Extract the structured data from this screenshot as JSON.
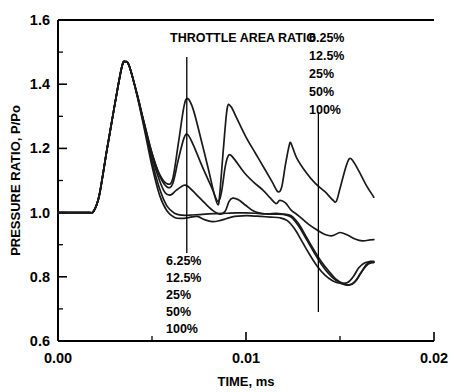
{
  "chart_data": {
    "type": "line",
    "title": "",
    "xlabel": "TIME, ms",
    "ylabel": "PRESSURE RATIO, P/Po",
    "xlim": [
      0.0,
      0.02
    ],
    "ylim": [
      0.6,
      1.6
    ],
    "xticks": [
      "0.00",
      "0.01",
      "0.02"
    ],
    "xtick_values": [
      0.0,
      0.01,
      0.02
    ],
    "xminor_values": [
      0.005,
      0.015
    ],
    "yticks": [
      "0.6",
      "0.8",
      "1.0",
      "1.2",
      "1.4",
      "1.6"
    ],
    "ytick_values": [
      0.6,
      0.8,
      1.0,
      1.2,
      1.4,
      1.6
    ],
    "yminor_values": [
      0.7,
      0.9,
      1.1,
      1.3,
      1.5
    ],
    "grid": false,
    "legend_position": "none",
    "annotations": {
      "upper_group_label": "THROTTLE AREA RATIO",
      "upper_series_labels": [
        "6.25%",
        "12.5%",
        "25%",
        "50%",
        "100%"
      ],
      "lower_series_labels": [
        "6.25%",
        "12.5%",
        "25%",
        "50%",
        "100%"
      ],
      "pointer_left_x": 0.00685,
      "pointer_right_x": 0.01385
    },
    "series": [
      {
        "name": "6.25%",
        "points": [
          [
            0.0,
            1.0
          ],
          [
            0.0016,
            1.0
          ],
          [
            0.0019,
            1.005
          ],
          [
            0.0022,
            1.055
          ],
          [
            0.0026,
            1.195
          ],
          [
            0.003,
            1.33
          ],
          [
            0.0034,
            1.455
          ],
          [
            0.0036,
            1.47
          ],
          [
            0.0038,
            1.455
          ],
          [
            0.0042,
            1.37
          ],
          [
            0.0046,
            1.275
          ],
          [
            0.005,
            1.185
          ],
          [
            0.0054,
            1.12
          ],
          [
            0.0058,
            1.09
          ],
          [
            0.0061,
            1.105
          ],
          [
            0.0064,
            1.215
          ],
          [
            0.0067,
            1.33
          ],
          [
            0.0069,
            1.355
          ],
          [
            0.0072,
            1.32
          ],
          [
            0.0076,
            1.23
          ],
          [
            0.008,
            1.135
          ],
          [
            0.0083,
            1.06
          ],
          [
            0.0085,
            1.025
          ],
          [
            0.0086,
            1.055
          ],
          [
            0.0088,
            1.2
          ],
          [
            0.009,
            1.325
          ],
          [
            0.0092,
            1.33
          ],
          [
            0.0095,
            1.295
          ],
          [
            0.01,
            1.235
          ],
          [
            0.0105,
            1.185
          ],
          [
            0.011,
            1.135
          ],
          [
            0.0114,
            1.095
          ],
          [
            0.0117,
            1.065
          ],
          [
            0.0119,
            1.08
          ],
          [
            0.0121,
            1.15
          ],
          [
            0.0123,
            1.21
          ],
          [
            0.0124,
            1.215
          ],
          [
            0.0127,
            1.17
          ],
          [
            0.0132,
            1.125
          ],
          [
            0.0137,
            1.09
          ],
          [
            0.0142,
            1.065
          ],
          [
            0.0146,
            1.04
          ],
          [
            0.0148,
            1.035
          ],
          [
            0.015,
            1.075
          ],
          [
            0.0153,
            1.14
          ],
          [
            0.0155,
            1.168
          ],
          [
            0.0157,
            1.16
          ],
          [
            0.016,
            1.13
          ],
          [
            0.0164,
            1.085
          ],
          [
            0.0168,
            1.048
          ]
        ]
      },
      {
        "name": "12.5%",
        "points": [
          [
            0.0,
            1.0
          ],
          [
            0.0016,
            1.0
          ],
          [
            0.0019,
            1.005
          ],
          [
            0.0022,
            1.055
          ],
          [
            0.0026,
            1.195
          ],
          [
            0.003,
            1.33
          ],
          [
            0.0034,
            1.455
          ],
          [
            0.0036,
            1.47
          ],
          [
            0.0038,
            1.455
          ],
          [
            0.0042,
            1.37
          ],
          [
            0.0046,
            1.275
          ],
          [
            0.005,
            1.185
          ],
          [
            0.0054,
            1.115
          ],
          [
            0.0058,
            1.08
          ],
          [
            0.0061,
            1.09
          ],
          [
            0.0064,
            1.165
          ],
          [
            0.0067,
            1.232
          ],
          [
            0.0069,
            1.243
          ],
          [
            0.0072,
            1.21
          ],
          [
            0.0077,
            1.14
          ],
          [
            0.0082,
            1.075
          ],
          [
            0.0085,
            1.035
          ],
          [
            0.0087,
            1.065
          ],
          [
            0.0089,
            1.145
          ],
          [
            0.0091,
            1.18
          ],
          [
            0.0094,
            1.165
          ],
          [
            0.0099,
            1.125
          ],
          [
            0.0104,
            1.095
          ],
          [
            0.0109,
            1.07
          ],
          [
            0.0113,
            1.045
          ],
          [
            0.0116,
            1.028
          ],
          [
            0.0118,
            1.038
          ],
          [
            0.0121,
            1.03
          ],
          [
            0.0124,
            1.008
          ],
          [
            0.0128,
            0.99
          ],
          [
            0.0133,
            0.965
          ],
          [
            0.0138,
            0.945
          ],
          [
            0.0142,
            0.932
          ],
          [
            0.0146,
            0.928
          ],
          [
            0.015,
            0.938
          ],
          [
            0.0154,
            0.93
          ],
          [
            0.0158,
            0.918
          ],
          [
            0.0162,
            0.912
          ],
          [
            0.0166,
            0.915
          ],
          [
            0.0168,
            0.916
          ]
        ]
      },
      {
        "name": "25%",
        "points": [
          [
            0.0,
            1.0
          ],
          [
            0.0016,
            1.0
          ],
          [
            0.0019,
            1.005
          ],
          [
            0.0022,
            1.055
          ],
          [
            0.0026,
            1.195
          ],
          [
            0.003,
            1.33
          ],
          [
            0.0034,
            1.455
          ],
          [
            0.0036,
            1.47
          ],
          [
            0.0038,
            1.455
          ],
          [
            0.0042,
            1.37
          ],
          [
            0.0046,
            1.272
          ],
          [
            0.005,
            1.175
          ],
          [
            0.0054,
            1.1
          ],
          [
            0.0057,
            1.062
          ],
          [
            0.006,
            1.055
          ],
          [
            0.0063,
            1.07
          ],
          [
            0.0067,
            1.085
          ],
          [
            0.0069,
            1.082
          ],
          [
            0.0073,
            1.06
          ],
          [
            0.0078,
            1.03
          ],
          [
            0.0082,
            1.008
          ],
          [
            0.0086,
            0.995
          ],
          [
            0.0089,
            1.005
          ],
          [
            0.0091,
            1.035
          ],
          [
            0.0093,
            1.045
          ],
          [
            0.0096,
            1.04
          ],
          [
            0.01,
            1.022
          ],
          [
            0.0104,
            1.005
          ],
          [
            0.0108,
            0.998
          ],
          [
            0.0112,
            0.996
          ],
          [
            0.0116,
            0.998
          ],
          [
            0.012,
            0.995
          ],
          [
            0.0124,
            0.99
          ],
          [
            0.0128,
            0.965
          ],
          [
            0.0132,
            0.925
          ],
          [
            0.0136,
            0.885
          ],
          [
            0.014,
            0.848
          ],
          [
            0.0144,
            0.818
          ],
          [
            0.0148,
            0.792
          ],
          [
            0.0152,
            0.778
          ],
          [
            0.0155,
            0.775
          ],
          [
            0.0158,
            0.785
          ],
          [
            0.0161,
            0.812
          ],
          [
            0.0164,
            0.838
          ],
          [
            0.0166,
            0.846
          ],
          [
            0.0168,
            0.845
          ]
        ]
      },
      {
        "name": "50%",
        "points": [
          [
            0.0,
            1.0
          ],
          [
            0.0016,
            1.0
          ],
          [
            0.0019,
            1.005
          ],
          [
            0.0022,
            1.055
          ],
          [
            0.0026,
            1.195
          ],
          [
            0.003,
            1.33
          ],
          [
            0.0034,
            1.455
          ],
          [
            0.0036,
            1.47
          ],
          [
            0.0038,
            1.455
          ],
          [
            0.0042,
            1.368
          ],
          [
            0.0046,
            1.265
          ],
          [
            0.005,
            1.16
          ],
          [
            0.0054,
            1.075
          ],
          [
            0.0058,
            1.02
          ],
          [
            0.0062,
            0.998
          ],
          [
            0.0066,
            0.992
          ],
          [
            0.007,
            0.992
          ],
          [
            0.0075,
            0.994
          ],
          [
            0.008,
            0.996
          ],
          [
            0.0085,
            0.997
          ],
          [
            0.009,
            0.998
          ],
          [
            0.0095,
            0.999
          ],
          [
            0.01,
            0.999
          ],
          [
            0.0105,
            0.998
          ],
          [
            0.011,
            0.996
          ],
          [
            0.0115,
            0.995
          ],
          [
            0.012,
            0.994
          ],
          [
            0.0124,
            0.986
          ],
          [
            0.0128,
            0.958
          ],
          [
            0.0132,
            0.918
          ],
          [
            0.0136,
            0.878
          ],
          [
            0.014,
            0.84
          ],
          [
            0.0144,
            0.81
          ],
          [
            0.0148,
            0.788
          ],
          [
            0.0152,
            0.776
          ],
          [
            0.0156,
            0.776
          ],
          [
            0.0159,
            0.792
          ],
          [
            0.0162,
            0.82
          ],
          [
            0.0165,
            0.84
          ],
          [
            0.0168,
            0.845
          ]
        ]
      },
      {
        "name": "100%",
        "points": [
          [
            0.0,
            1.0
          ],
          [
            0.0016,
            1.0
          ],
          [
            0.0019,
            1.005
          ],
          [
            0.0022,
            1.055
          ],
          [
            0.0026,
            1.195
          ],
          [
            0.003,
            1.33
          ],
          [
            0.0034,
            1.455
          ],
          [
            0.0036,
            1.47
          ],
          [
            0.0038,
            1.455
          ],
          [
            0.0042,
            1.366
          ],
          [
            0.0046,
            1.258
          ],
          [
            0.005,
            1.145
          ],
          [
            0.0054,
            1.055
          ],
          [
            0.0058,
            1.005
          ],
          [
            0.0062,
            0.985
          ],
          [
            0.0066,
            0.982
          ],
          [
            0.007,
            0.985
          ],
          [
            0.0074,
            0.988
          ],
          [
            0.0078,
            0.978
          ],
          [
            0.0082,
            0.972
          ],
          [
            0.0086,
            0.975
          ],
          [
            0.009,
            0.982
          ],
          [
            0.0094,
            0.988
          ],
          [
            0.0098,
            0.99
          ],
          [
            0.0103,
            0.99
          ],
          [
            0.0108,
            0.988
          ],
          [
            0.0113,
            0.986
          ],
          [
            0.0118,
            0.984
          ],
          [
            0.0122,
            0.975
          ],
          [
            0.0126,
            0.948
          ],
          [
            0.013,
            0.908
          ],
          [
            0.0134,
            0.868
          ],
          [
            0.0138,
            0.832
          ],
          [
            0.0142,
            0.805
          ],
          [
            0.0146,
            0.788
          ],
          [
            0.015,
            0.78
          ],
          [
            0.0154,
            0.782
          ],
          [
            0.0157,
            0.8
          ],
          [
            0.016,
            0.828
          ],
          [
            0.0163,
            0.843
          ],
          [
            0.0166,
            0.848
          ],
          [
            0.0168,
            0.848
          ]
        ]
      }
    ]
  }
}
